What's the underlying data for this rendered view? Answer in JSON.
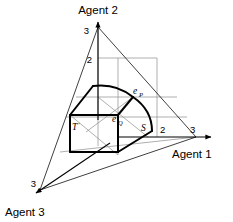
{
  "figure": {
    "type": "simplex-diagram",
    "background_color": "#ffffff",
    "line_color": "#000000",
    "grid_color": "#8c8c8c",
    "bold_stroke_width": 2.0,
    "thin_stroke_width": 0.7,
    "axes": [
      {
        "id": "agent1",
        "label": "Agent 1",
        "label_x": 175,
        "label_y": 155,
        "direction": "right",
        "vertex_x": 196,
        "vertex_y": 137,
        "arrow_tip_x": 214,
        "arrow_tip_y": 137,
        "ticks": [
          {
            "value": "2",
            "x": 160,
            "y": 131
          },
          {
            "value": "3",
            "x": 189,
            "y": 133
          }
        ]
      },
      {
        "id": "agent2",
        "label": "Agent 2",
        "label_x": 75,
        "label_y": 14,
        "direction": "up",
        "vertex_x": 98,
        "vertex_y": 27,
        "arrow_tip_x": 98,
        "arrow_tip_y": 19,
        "ticks": [
          {
            "value": "2",
            "x": 93,
            "y": 61
          },
          {
            "value": "3",
            "x": 90,
            "y": 31
          }
        ]
      },
      {
        "id": "agent3",
        "label": "Agent 3",
        "label_x": 6,
        "label_y": 215,
        "direction": "down-left",
        "vertex_x": 40,
        "vertex_y": 190,
        "arrow_tip_x": 33,
        "arrow_tip_y": 196,
        "ticks": [
          {
            "value": "3",
            "x": 32,
            "y": 186
          }
        ]
      }
    ],
    "point_labels": [
      {
        "id": "eP",
        "base": "e",
        "sub": "P",
        "x": 136,
        "y": 94
      },
      {
        "id": "eQ",
        "base": "e",
        "sub": "Q",
        "x": 115,
        "y": 122
      },
      {
        "id": "S",
        "base": "S",
        "sub": "",
        "x": 144,
        "y": 130
      },
      {
        "id": "Tprime",
        "base": "T",
        "sub": "",
        "prime": "'",
        "x": 72,
        "y": 130
      }
    ],
    "simplex_triangle": {
      "vertices": [
        {
          "x": 98,
          "y": 27
        },
        {
          "x": 196,
          "y": 137
        },
        {
          "x": 40,
          "y": 190
        }
      ]
    },
    "bold_region": {
      "description": "feasible set with arc boundary and rectangular box",
      "arc_outer_points": [
        {
          "x": 93,
          "y": 86
        },
        {
          "x": 133,
          "y": 97
        },
        {
          "x": 152,
          "y": 131
        }
      ]
    },
    "grid_lines_count": 10
  }
}
